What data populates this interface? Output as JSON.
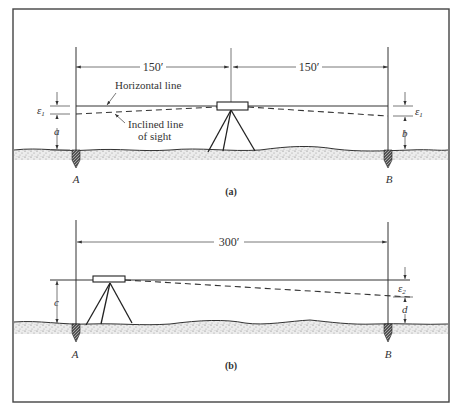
{
  "figure": {
    "panel_a": {
      "caption": "(a)",
      "dimension_left": "150′",
      "dimension_right": "150′",
      "label_horizontal_line": "Horizontal line",
      "label_inclined_line_1": "Inclined line",
      "label_inclined_line_2": "of sight",
      "point_a": "A",
      "point_b": "B",
      "error_left": "ε",
      "error_left_sub": "1",
      "error_right": "ε",
      "error_right_sub": "1",
      "reading_left": "a",
      "reading_right": "b"
    },
    "panel_b": {
      "caption": "(b)",
      "dimension": "300′",
      "point_a": "A",
      "point_b": "B",
      "error_right": "ε",
      "error_right_sub": "2",
      "instrument_height": "c",
      "reading_right": "d"
    },
    "colors": {
      "ink": "#333333",
      "ground_fill": "#d8d8d8",
      "background": "#ffffff"
    }
  }
}
